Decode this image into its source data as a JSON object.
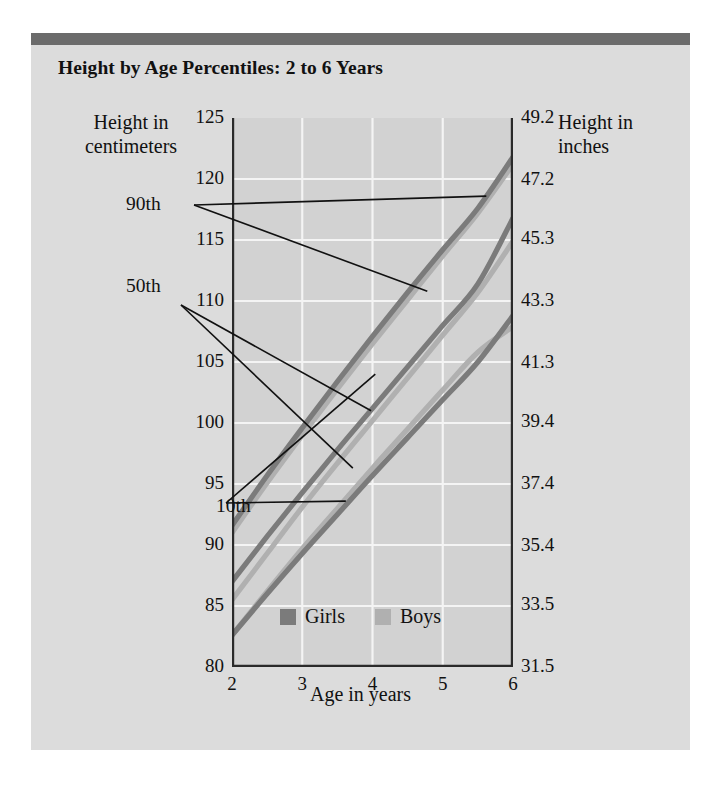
{
  "figure": {
    "title": "Height by Age Percentiles: 2 to 6 Years",
    "panel_bg": "#dcdcdc",
    "topbar_color": "#6b6b6b",
    "plot_bg": "#d2d2d2",
    "grid_color": "#f4f4f4"
  },
  "legend": {
    "position": "bottom-center",
    "items": [
      {
        "label": "Girls",
        "color": "#7b7b7b"
      },
      {
        "label": "Boys",
        "color": "#b0b0b0"
      }
    ]
  },
  "annotations": [
    {
      "id": "p90",
      "label": "90th"
    },
    {
      "id": "p50",
      "label": "50th"
    },
    {
      "id": "p10",
      "label": "10th"
    }
  ],
  "chart_data": {
    "type": "line",
    "title": "Height by Age Percentiles: 2 to 6 Years",
    "xlabel": "Age in years",
    "ylabel": "Height in centimeters",
    "ylabel_secondary": "Height in inches",
    "xlim": [
      2,
      6
    ],
    "ylim": [
      80,
      125
    ],
    "ylim_secondary": [
      31.5,
      49.2
    ],
    "grid": true,
    "xticks": [
      2,
      3,
      4,
      5,
      6
    ],
    "xticklabels": [
      "2",
      "3",
      "4",
      "5",
      "6"
    ],
    "yticks": [
      80,
      85,
      90,
      95,
      100,
      105,
      110,
      115,
      120,
      125
    ],
    "yticklabels": [
      "80",
      "85",
      "90",
      "95",
      "100",
      "105",
      "110",
      "115",
      "120",
      "125"
    ],
    "yticks_secondary": [
      31.5,
      33.5,
      35.4,
      37.4,
      39.4,
      41.3,
      43.3,
      45.3,
      47.2,
      49.2
    ],
    "yticklabels_secondary": [
      "31.5",
      "33.5",
      "35.4",
      "37.4",
      "39.4",
      "41.3",
      "43.3",
      "45.3",
      "47.2",
      "49.2"
    ],
    "x": [
      2,
      2.5,
      3,
      3.5,
      4,
      4.5,
      5,
      5.5,
      6
    ],
    "series": [
      {
        "name": "Girls 90th",
        "group": "Girls",
        "percentile": "90th",
        "color": "#7b7b7b",
        "values": [
          91.6,
          95.7,
          99.6,
          103.4,
          107.1,
          110.7,
          114.2,
          117.6,
          121.8
        ]
      },
      {
        "name": "Boys 90th",
        "group": "Boys",
        "percentile": "90th",
        "color": "#b0b0b0",
        "values": [
          91.0,
          95.1,
          99.0,
          102.8,
          106.5,
          110.1,
          113.7,
          117.2,
          121.2
        ]
      },
      {
        "name": "Girls 50th",
        "group": "Girls",
        "percentile": "50th",
        "color": "#7b7b7b",
        "values": [
          87.0,
          90.7,
          94.3,
          97.8,
          101.2,
          104.6,
          108.0,
          111.4,
          116.8
        ]
      },
      {
        "name": "Boys 50th",
        "group": "Boys",
        "percentile": "50th",
        "color": "#b0b0b0",
        "values": [
          85.5,
          89.3,
          93.1,
          96.7,
          100.2,
          103.7,
          107.2,
          110.7,
          114.9
        ]
      },
      {
        "name": "Girls 10th",
        "group": "Girls",
        "percentile": "10th",
        "color": "#7b7b7b",
        "values": [
          82.6,
          86.0,
          89.3,
          92.5,
          95.7,
          98.8,
          101.9,
          105.0,
          108.8
        ]
      },
      {
        "name": "Boys 10th",
        "group": "Boys",
        "percentile": "10th",
        "color": "#b0b0b0",
        "values": [
          82.6,
          86.2,
          89.7,
          93.0,
          96.3,
          99.5,
          102.7,
          105.8,
          107.9
        ]
      }
    ]
  }
}
